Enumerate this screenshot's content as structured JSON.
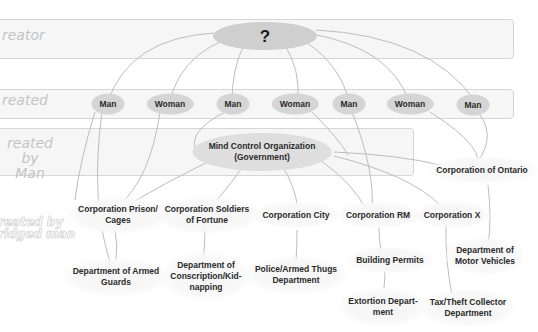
{
  "bands": [
    {
      "id": "creator",
      "label": "reator"
    },
    {
      "id": "created",
      "label": "reated"
    },
    {
      "id": "created-by-man",
      "label_line1": "reated by",
      "label_line2": "Man"
    }
  ],
  "watermark": {
    "line1": "reated by",
    "line2": "ridged man"
  },
  "creator_node": {
    "label": "?"
  },
  "created_nodes": [
    {
      "label": "Man"
    },
    {
      "label": "Woman"
    },
    {
      "label": "Man"
    },
    {
      "label": "Woman"
    },
    {
      "label": "Man"
    },
    {
      "label": "Woman"
    },
    {
      "label": "Man"
    }
  ],
  "government_node": {
    "line1": "Mind Control Organization",
    "line2": "(Government)"
  },
  "corporations": [
    {
      "line1": "Corporation Prison/",
      "line2": "Cages"
    },
    {
      "line1": "Corporation Soldiers",
      "line2": "of Fortune"
    },
    {
      "line1": "Corporation City",
      "line2": ""
    },
    {
      "line1": "Corporation RM",
      "line2": ""
    },
    {
      "line1": "Corporation X",
      "line2": ""
    },
    {
      "line1": "Corporation of Ontario",
      "line2": ""
    }
  ],
  "departments": [
    {
      "line1": "Department of Armed",
      "line2": "Guards",
      "line3": ""
    },
    {
      "line1": "Department of",
      "line2": "Conscription/Kid-",
      "line3": "napping"
    },
    {
      "line1": "Police/Armed Thugs",
      "line2": "Department",
      "line3": ""
    },
    {
      "line1": "Building Permits",
      "line2": "",
      "line3": ""
    },
    {
      "line1": "Extortion Depart-",
      "line2": "ment",
      "line3": ""
    },
    {
      "line1": "Department of",
      "line2": "Motor Vehicles",
      "line3": ""
    },
    {
      "line1": "Tax/Theft Collector",
      "line2": "Department",
      "line3": ""
    }
  ],
  "colors": {
    "band_fill": "#f6f6f6",
    "band_border": "#d6d6d6",
    "node_fill": "#d5d5d5",
    "link": "#bdbdbd",
    "label_gray": "#c4c4c4",
    "text": "#2b2b2b"
  }
}
